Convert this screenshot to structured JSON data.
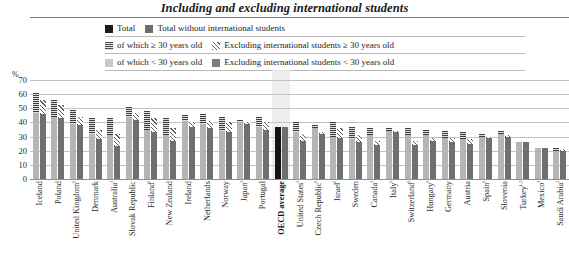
{
  "title": "Including and excluding international students",
  "unit_label": "%",
  "legend": [
    [
      {
        "swatch": "sw-total",
        "label": "Total",
        "name": "legend-total"
      },
      {
        "swatch": "sw-total-wo",
        "label": "Total without international students",
        "name": "legend-total-without-international"
      }
    ],
    [
      {
        "swatch": "sw-ge30",
        "label": "of which ≥ 30 years old",
        "name": "legend-of-which-ge30"
      },
      {
        "swatch": "sw-excl-ge30",
        "label": "Excluding international students ≥ 30 years old",
        "name": "legend-excluding-ge30"
      }
    ],
    [
      {
        "swatch": "sw-lt30",
        "label": "of which < 30 years old",
        "name": "legend-of-which-lt30"
      },
      {
        "swatch": "sw-excl-lt30",
        "label": "Excluding international students < 30 years old",
        "name": "legend-excluding-lt30"
      }
    ]
  ],
  "chart_data": {
    "type": "bar",
    "title": "Including and excluding international students",
    "xlabel": "",
    "ylabel": "%",
    "ylim": [
      0,
      70
    ],
    "yticks": [
      0,
      10,
      20,
      30,
      40,
      50,
      60,
      70
    ],
    "grid": true,
    "legend_position": "top",
    "stacked": true,
    "group_note": "Each country shows two stacked bars: (1) Total = '< 30 years old' + '≥ 30 years old'; (2) Total without international students = 'Excluding international students < 30 years old' + 'Excluding international students ≥ 30 years old'. The OECD average group is drawn with solid fills.",
    "categories": [
      "Iceland",
      "Poland",
      "United Kingdom¹",
      "Denmark",
      "Australia²",
      "Slovak Republic",
      "Finland¹",
      "New Zealand",
      "Ireland",
      "Netherlands",
      "Norway",
      "Japan³",
      "Portugal",
      "OECD average",
      "United States³",
      "Czech Republic¹",
      "Israel¹",
      "Sweden",
      "Canada²",
      "Italy¹",
      "Switzerland¹",
      "Hungary¹",
      "Germany",
      "Austria",
      "Spain¹",
      "Slovenia",
      "Turkey¹˒³",
      "Mexico²",
      "Saudi Arabia³"
    ],
    "series": [
      {
        "name": "of which < 30 years old",
        "values": [
          47,
          44,
          39,
          32,
          31,
          44,
          35,
          31,
          41,
          39,
          34,
          40,
          37,
          34,
          33,
          36,
          30,
          28,
          31,
          34,
          31,
          31,
          29,
          28,
          30,
          32,
          26,
          22,
          20
        ]
      },
      {
        "name": "of which ≥ 30 years old",
        "values": [
          14,
          12,
          10,
          11,
          12,
          7,
          13,
          12,
          4,
          7,
          10,
          2,
          7,
          3,
          7,
          2,
          10,
          9,
          5,
          2,
          5,
          4,
          5,
          5,
          2,
          2,
          0,
          0,
          2
        ]
      },
      {
        "name": "Excluding international students < 30 years old",
        "values": [
          46,
          43,
          38,
          28,
          23,
          42,
          33,
          27,
          37,
          36,
          33,
          39,
          35,
          34,
          27,
          32,
          29,
          26,
          24,
          33,
          24,
          27,
          26,
          25,
          29,
          30,
          26,
          22,
          20
        ]
      },
      {
        "name": "Excluding international students ≥ 30 years old",
        "values": [
          10,
          9,
          6,
          7,
          9,
          5,
          10,
          9,
          3,
          5,
          7,
          1,
          5,
          3,
          5,
          1,
          7,
          5,
          3,
          1,
          3,
          2,
          3,
          3,
          1,
          1,
          0,
          0,
          1
        ]
      }
    ],
    "series_totals": {
      "Total": [
        61,
        56,
        49,
        43,
        43,
        51,
        48,
        43,
        45,
        46,
        44,
        42,
        44,
        37,
        40,
        38,
        40,
        37,
        36,
        36,
        36,
        35,
        34,
        33,
        32,
        34,
        26,
        22,
        22
      ],
      "Total without international students": [
        56,
        52,
        44,
        35,
        32,
        47,
        43,
        36,
        40,
        41,
        40,
        40,
        40,
        37,
        32,
        33,
        36,
        31,
        27,
        34,
        27,
        29,
        29,
        28,
        30,
        31,
        26,
        22,
        21
      ]
    }
  }
}
